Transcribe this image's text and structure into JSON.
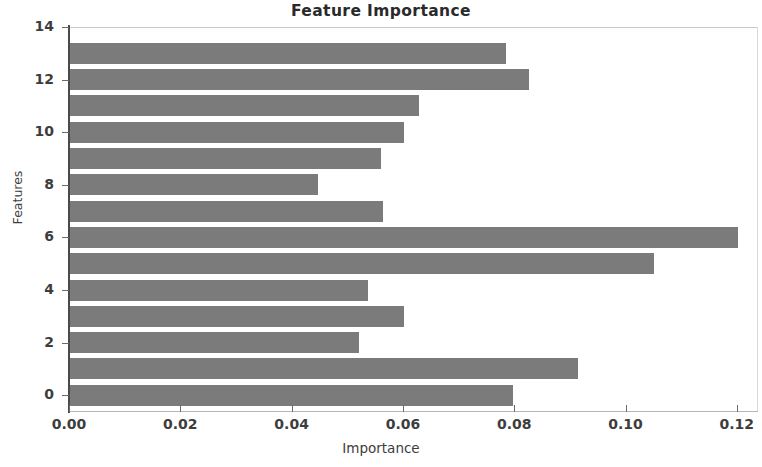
{
  "chart_data": {
    "type": "bar",
    "orientation": "horizontal",
    "title": "Feature Importance",
    "xlabel": "Importance",
    "ylabel": "Features",
    "categories": [
      "0",
      "1",
      "2",
      "3",
      "4",
      "5",
      "6",
      "7",
      "8",
      "9",
      "10",
      "11",
      "12",
      "13"
    ],
    "values": [
      0.0798,
      0.0914,
      0.0521,
      0.0602,
      0.0537,
      0.1051,
      0.1202,
      0.0564,
      0.0448,
      0.056,
      0.0602,
      0.0629,
      0.0826,
      0.0786
    ],
    "xlim": [
      0.0,
      0.1238
    ],
    "ylim": [
      -0.6,
      14.0
    ],
    "xticks": [
      0.0,
      0.02,
      0.04,
      0.06,
      0.08,
      0.1,
      0.12
    ],
    "xticklabels": [
      "0.00",
      "0.02",
      "0.04",
      "0.06",
      "0.08",
      "0.10",
      "0.12"
    ],
    "yticks": [
      0,
      2,
      4,
      6,
      8,
      10,
      12,
      14
    ],
    "yticklabels": [
      "0",
      "2",
      "4",
      "6",
      "8",
      "10",
      "12",
      "14"
    ],
    "grid": false,
    "legend": null,
    "bar_color": "#7b7b7b",
    "background_color": "#ffffff"
  }
}
